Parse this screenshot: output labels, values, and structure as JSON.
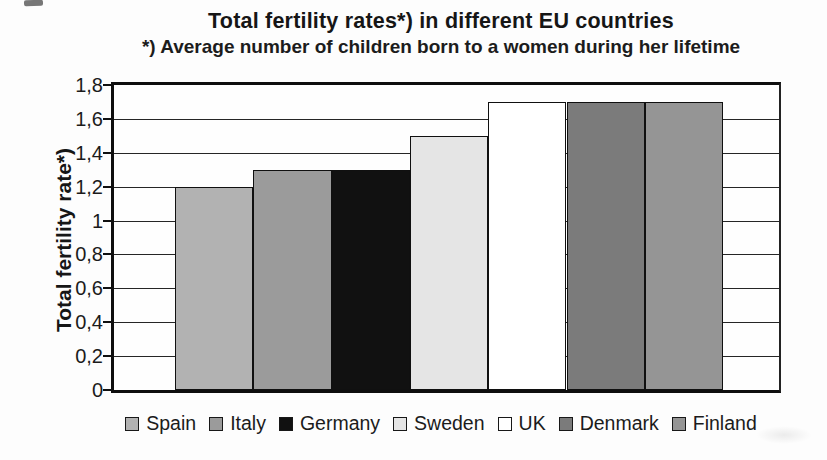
{
  "chart_data": {
    "type": "bar",
    "title": "Total fertility rates*) in different EU countries",
    "subtitle": "*) Average number of children born to a women during her lifetime",
    "ylabel": "Total fertility rate*)",
    "xlabel": "",
    "categories": [
      "Spain",
      "Italy",
      "Germany",
      "Sweden",
      "UK",
      "Denmark",
      "Finland"
    ],
    "values": [
      1.2,
      1.3,
      1.3,
      1.5,
      1.7,
      1.7,
      1.7
    ],
    "bar_colors": [
      "#b2b2b2",
      "#9b9b9b",
      "#111111",
      "#e5e5e5",
      "#ffffff",
      "#7b7b7b",
      "#959595"
    ],
    "ylim": [
      0,
      1.8
    ],
    "ytick_step": 0.2,
    "yticks": [
      {
        "value": 0,
        "label": "0"
      },
      {
        "value": 0.2,
        "label": "0,2"
      },
      {
        "value": 0.4,
        "label": "0,4"
      },
      {
        "value": 0.6,
        "label": "0,6"
      },
      {
        "value": 0.8,
        "label": "0,8"
      },
      {
        "value": 1,
        "label": "1"
      },
      {
        "value": 1.2,
        "label": "1,2"
      },
      {
        "value": 1.4,
        "label": "1,4"
      },
      {
        "value": 1.6,
        "label": "1,6"
      },
      {
        "value": 1.8,
        "label": "1,8"
      }
    ],
    "grid": true,
    "legend_position": "bottom",
    "frame_color": "#0e0e0e",
    "gridline_color": "#262626",
    "background": "#fdfdfd"
  }
}
